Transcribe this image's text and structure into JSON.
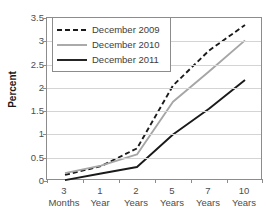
{
  "chart_data": {
    "type": "line",
    "title": "",
    "xlabel": "",
    "ylabel": "Percent",
    "ylim": [
      0,
      3.5
    ],
    "ytick_values": [
      0,
      0.5,
      1,
      1.5,
      2,
      2.5,
      3,
      3.5
    ],
    "ytick_labels": [
      "0",
      "0.5",
      "1",
      "1.5",
      "2",
      "2.5",
      "3",
      "3.5"
    ],
    "categories": [
      "3 Months",
      "1 Year",
      "2 Years",
      "5 Years",
      "7 Years",
      "10 Years"
    ],
    "category_numbers": [
      "3",
      "1",
      "2",
      "5",
      "7",
      "10"
    ],
    "category_units": [
      "Months",
      "Year",
      "Years",
      "Years",
      "Years",
      "Years"
    ],
    "grid": true,
    "legend_position": "upper-left-inside",
    "series": [
      {
        "name": "December 2009",
        "style": "dashed",
        "color": "#1a1a1a",
        "values": [
          0.13,
          0.32,
          0.7,
          2.05,
          2.8,
          3.35
        ]
      },
      {
        "name": "December 2010",
        "style": "solid",
        "color": "#a6a6a6",
        "values": [
          0.17,
          0.33,
          0.57,
          1.7,
          2.35,
          3.02
        ]
      },
      {
        "name": "December 2011",
        "style": "solid",
        "color": "#1a1a1a",
        "values": [
          0.02,
          0.16,
          0.3,
          1.0,
          1.55,
          2.17
        ]
      }
    ]
  }
}
